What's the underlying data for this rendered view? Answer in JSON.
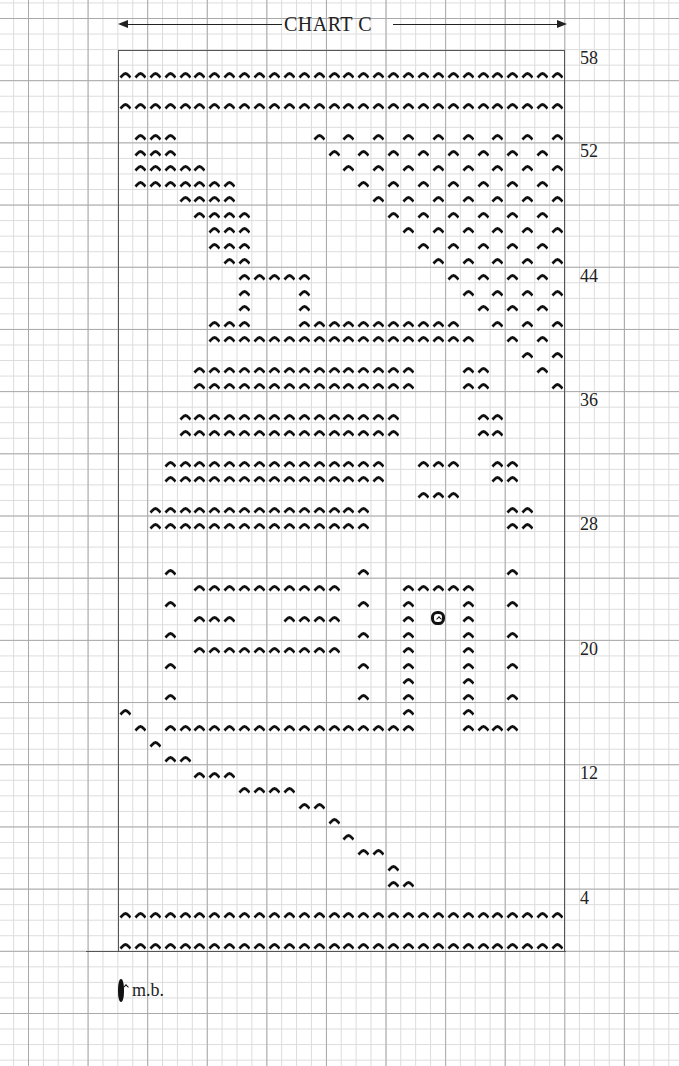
{
  "chart_data": {
    "type": "knitting-chart",
    "title": "CHART C",
    "columns": 30,
    "rows": 58,
    "row_labels": [
      58,
      52,
      44,
      36,
      28,
      20,
      12,
      4
    ],
    "symbols": {
      "purl": {
        "glyph": "^",
        "description": "purl stitch"
      },
      "mb": {
        "glyph": "mb",
        "description": "make bobble"
      }
    },
    "legend": [
      {
        "symbol": "mb",
        "label": "m.b."
      }
    ],
    "purl_cells_by_row": {
      "57": "1-30",
      "55": "1-30",
      "53": "2-4,14,16,18,20,22,24,26,28,30",
      "52": "2-4,15,17,19,21,23,25,27,29",
      "51": "2-6,16,18,20,22,24,26,28,30",
      "50": "2-8,17,19,21,23,25,27,29",
      "49": "5-8,18,20,22,24,26,28,30",
      "48": "6-9,19,21,23,25,27,29",
      "47": "7-9,20,22,24,26,28,30",
      "46": "7-9,21,23,25,27,29",
      "45": "8-9,22,24,26,28,30",
      "44": "9-13,23,25,27,29",
      "43": "9,13,24,26,28,30",
      "42": "9,13,25,27,29",
      "41": "7-9,13-23,26,28,30",
      "40": "7-24,27,29",
      "39": "28,30",
      "38": "6-20,24-25,29",
      "37": "6-20,24-25,30",
      "35": "5-19,25-26",
      "34": "5-19,25-26",
      "32": "4-18,21-23,26-27",
      "31": "4-18,26-27",
      "30": "21-23",
      "29": "3-17,27-28",
      "28": "3-17,27-28",
      "25": "4,17,27",
      "24": "6-15,20-24",
      "23": "4,17,20,24,27",
      "22": "6-8,12-15,20,24",
      "21": "4,17,20,24,27",
      "20": "6-15,20,24",
      "19": "4,17,20,24,27",
      "18": "20,24",
      "17": "4,17,20,24,27",
      "16": "1,20,24",
      "15": "2,4-20,24-27",
      "14": "3",
      "13": "4-5",
      "12": "6-8",
      "11": "9-12",
      "10": "13-14",
      "9": "15",
      "8": "16",
      "7": "17-18",
      "6": "19",
      "5": "19-20",
      "3": "1-30",
      "1": "1-30"
    },
    "mb_cells": [
      {
        "row": 22,
        "col": 22
      }
    ],
    "grid": true
  },
  "labels": {
    "title": "CHART C",
    "legend_mb": "m.b."
  }
}
